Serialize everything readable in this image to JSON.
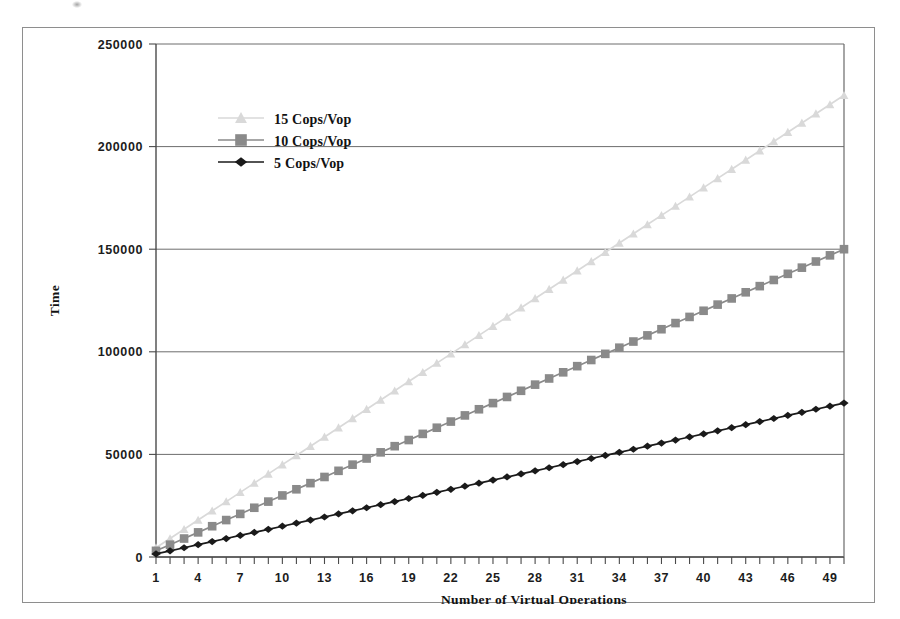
{
  "figure": {
    "background_color": "#ffffff",
    "frame_color": "#8e8e8e"
  },
  "chart_data": {
    "type": "line",
    "title": "",
    "xlabel": "Number of Virtual Operations",
    "ylabel": "Time",
    "xlim": [
      1,
      50
    ],
    "ylim": [
      0,
      250000
    ],
    "yticks": [
      0,
      50000,
      100000,
      150000,
      200000,
      250000
    ],
    "ytick_labels": [
      "0",
      "50000",
      "100000",
      "150000",
      "200000",
      "250000"
    ],
    "xticks": [
      1,
      4,
      7,
      10,
      13,
      16,
      19,
      22,
      25,
      28,
      31,
      34,
      37,
      40,
      43,
      46,
      49
    ],
    "xtick_labels": [
      "1",
      "4",
      "7",
      "10",
      "13",
      "16",
      "19",
      "22",
      "25",
      "28",
      "31",
      "34",
      "37",
      "40",
      "43",
      "46",
      "49"
    ],
    "x": [
      1,
      2,
      3,
      4,
      5,
      6,
      7,
      8,
      9,
      10,
      11,
      12,
      13,
      14,
      15,
      16,
      17,
      18,
      19,
      20,
      21,
      22,
      23,
      24,
      25,
      26,
      27,
      28,
      29,
      30,
      31,
      32,
      33,
      34,
      35,
      36,
      37,
      38,
      39,
      40,
      41,
      42,
      43,
      44,
      45,
      46,
      47,
      48,
      49,
      50
    ],
    "grid": true,
    "grid_axis": "y",
    "legend_position": "upper-left-inside",
    "series": [
      {
        "name": "15 Cops/Vop",
        "color": "#d9d9d9",
        "marker": "triangle",
        "slope": 4500,
        "values": [
          4500,
          9000,
          13500,
          18000,
          22500,
          27000,
          31500,
          36000,
          40500,
          45000,
          49500,
          54000,
          58500,
          63000,
          67500,
          72000,
          76500,
          81000,
          85500,
          90000,
          94500,
          99000,
          103500,
          108000,
          112500,
          117000,
          121500,
          126000,
          130500,
          135000,
          139500,
          144000,
          148500,
          153000,
          157500,
          162000,
          166500,
          171000,
          175500,
          180000,
          184500,
          189000,
          193500,
          198000,
          202500,
          207000,
          211500,
          216000,
          220500,
          225000
        ]
      },
      {
        "name": "10 Cops/Vop",
        "color": "#8a8a8a",
        "marker": "square",
        "slope": 3000,
        "values": [
          3000,
          6000,
          9000,
          12000,
          15000,
          18000,
          21000,
          24000,
          27000,
          30000,
          33000,
          36000,
          39000,
          42000,
          45000,
          48000,
          51000,
          54000,
          57000,
          60000,
          63000,
          66000,
          69000,
          72000,
          75000,
          78000,
          81000,
          84000,
          87000,
          90000,
          93000,
          96000,
          99000,
          102000,
          105000,
          108000,
          111000,
          114000,
          117000,
          120000,
          123000,
          126000,
          129000,
          132000,
          135000,
          138000,
          141000,
          144000,
          147000,
          150000
        ]
      },
      {
        "name": "5 Cops/Vop",
        "color": "#1a1a1a",
        "marker": "diamond",
        "slope": 1500,
        "values": [
          1500,
          3000,
          4500,
          6000,
          7500,
          9000,
          10500,
          12000,
          13500,
          15000,
          16500,
          18000,
          19500,
          21000,
          22500,
          24000,
          25500,
          27000,
          28500,
          30000,
          31500,
          33000,
          34500,
          36000,
          37500,
          39000,
          40500,
          42000,
          43500,
          45000,
          46500,
          48000,
          49500,
          51000,
          52500,
          54000,
          55500,
          57000,
          58500,
          60000,
          61500,
          63000,
          64500,
          66000,
          67500,
          69000,
          70500,
          72000,
          73500,
          75000
        ]
      }
    ],
    "legend_entries": [
      {
        "label": "15 Cops/Vop",
        "color": "#d9d9d9",
        "marker": "triangle"
      },
      {
        "label": "10 Cops/Vop",
        "color": "#8a8a8a",
        "marker": "square"
      },
      {
        "label": "5 Cops/Vop",
        "color": "#1a1a1a",
        "marker": "diamond"
      }
    ]
  }
}
